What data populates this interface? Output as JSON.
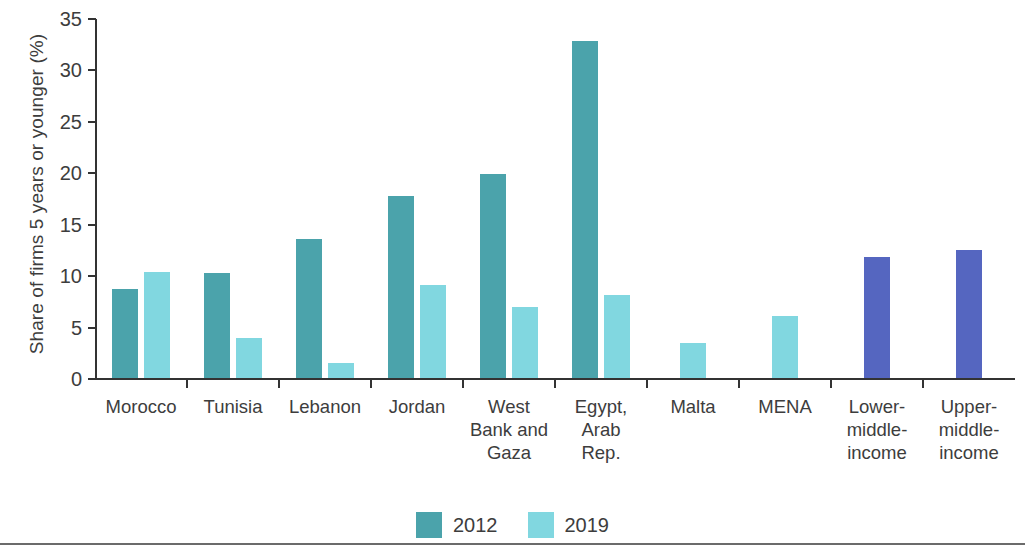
{
  "chart_data": {
    "type": "bar",
    "title": "",
    "xlabel": "",
    "ylabel": "Share of firms 5 years or younger (%)",
    "ylim": [
      0,
      35
    ],
    "ytick_labels": [
      "0",
      "5",
      "10",
      "15",
      "20",
      "25",
      "30",
      "35"
    ],
    "ytick_values": [
      0,
      5,
      10,
      15,
      20,
      25,
      30,
      35
    ],
    "grid": false,
    "legend_position": "bottom-center",
    "categories": [
      "Morocco",
      "Tunisia",
      "Lebanon",
      "Jordan",
      "West Bank and Gaza",
      "Egypt, Arab Rep.",
      "Malta",
      "MENA",
      "Lower-middle-income",
      "Upper-middle-income"
    ],
    "category_label_lines": [
      [
        "Morocco"
      ],
      [
        "Tunisia"
      ],
      [
        "Lebanon"
      ],
      [
        "Jordan"
      ],
      [
        "West",
        "Bank and",
        "Gaza"
      ],
      [
        "Egypt,",
        "Arab",
        "Rep."
      ],
      [
        "Malta"
      ],
      [
        "MENA"
      ],
      [
        "Lower-",
        "middle-",
        "income"
      ],
      [
        "Upper-",
        "middle-",
        "income"
      ]
    ],
    "series": [
      {
        "name": "2012",
        "color": "#4ba3ab",
        "values": [
          8.7,
          10.2,
          13.5,
          17.7,
          19.8,
          32.8,
          null,
          null,
          11.8,
          12.4
        ]
      },
      {
        "name": "2019",
        "color": "#81d7e0",
        "values": [
          10.3,
          3.9,
          1.5,
          9.0,
          6.9,
          8.1,
          3.4,
          6.0,
          null,
          null
        ]
      }
    ],
    "income_series_color": "#5566c0",
    "income_categories": [
      "Lower-middle-income",
      "Upper-middle-income"
    ],
    "income_values": [
      11.8,
      12.4
    ]
  },
  "legend": {
    "items": [
      {
        "label": "2012",
        "color": "#4ba3ab"
      },
      {
        "label": "2019",
        "color": "#81d7e0"
      }
    ]
  }
}
